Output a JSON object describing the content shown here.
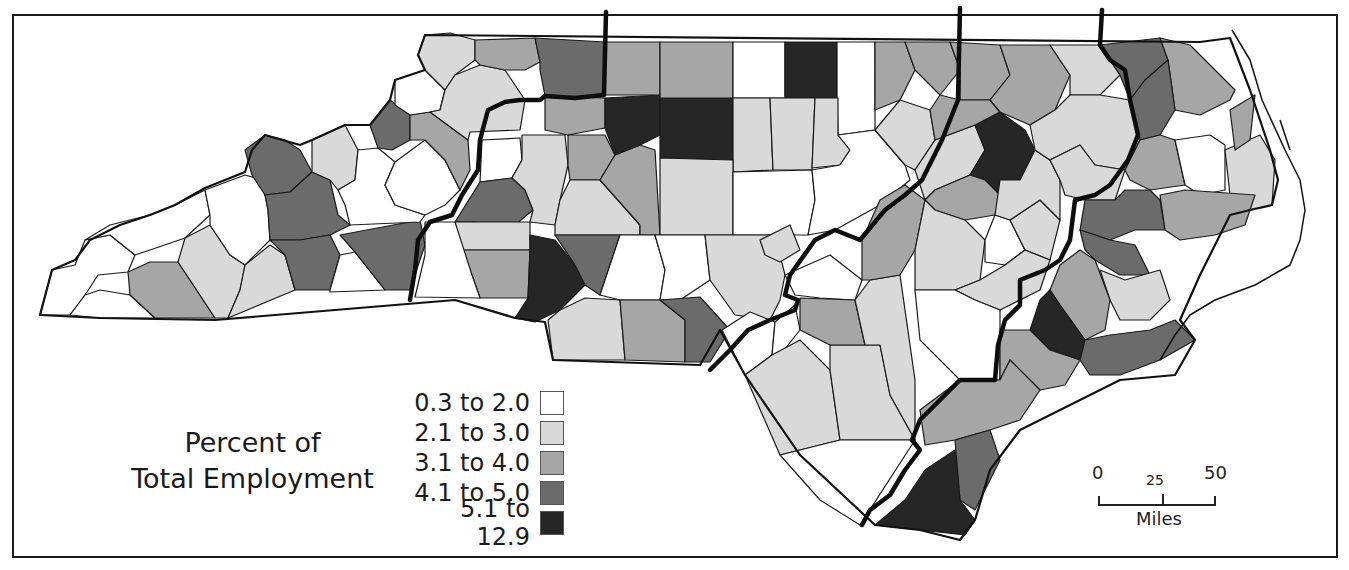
{
  "map": {
    "title_line1": "Percent of",
    "title_line2": "Total Employment",
    "subject": "North Carolina counties",
    "legend": [
      {
        "label": "0.3 to 2.0",
        "color": "#ffffff"
      },
      {
        "label": "2.1 to 3.0",
        "color": "#d9d9d9"
      },
      {
        "label": "3.1 to 4.0",
        "color": "#a6a6a6"
      },
      {
        "label": "4.1 to 5.0",
        "color": "#6b6b6b"
      },
      {
        "label": "5.1 to 12.9",
        "color": "#262626"
      }
    ],
    "scale_bar": {
      "tick_0": "0",
      "tick_25": "25",
      "tick_50": "50",
      "unit": "Miles"
    }
  }
}
